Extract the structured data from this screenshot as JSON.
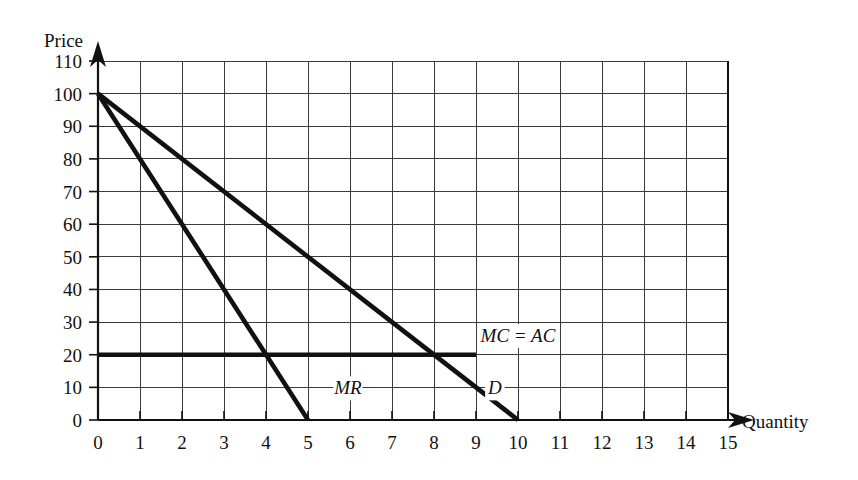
{
  "chart_data": {
    "type": "line",
    "title": "",
    "xlabel": "Quantity",
    "ylabel": "Price",
    "xlim": [
      0,
      15
    ],
    "ylim": [
      0,
      110
    ],
    "xticks": [
      "0",
      "1",
      "2",
      "3",
      "4",
      "5",
      "6",
      "7",
      "8",
      "9",
      "10",
      "11",
      "12",
      "13",
      "14",
      "15"
    ],
    "yticks": [
      "0",
      "10",
      "20",
      "30",
      "40",
      "50",
      "60",
      "70",
      "80",
      "90",
      "100",
      "110"
    ],
    "grid": true,
    "legend_position": "inline-labels",
    "series": [
      {
        "name": "D",
        "label": "D",
        "label_x": 9.45,
        "label_y": 10,
        "type": "line",
        "x": [
          0,
          10
        ],
        "values": [
          100,
          0
        ],
        "slope": -10,
        "intercept": 100,
        "color": "#111111"
      },
      {
        "name": "MR",
        "label": "MR",
        "label_x": 5.95,
        "label_y": 10,
        "type": "line",
        "x": [
          0,
          5
        ],
        "values": [
          100,
          0
        ],
        "slope": -20,
        "intercept": 100,
        "color": "#111111"
      },
      {
        "name": "MC = AC",
        "label": "MC = AC",
        "label_x": 10.0,
        "label_y": 26,
        "type": "line",
        "x": [
          0,
          9
        ],
        "values": [
          20,
          20
        ],
        "slope": 0,
        "intercept": 20,
        "color": "#111111"
      }
    ],
    "annotations": [
      {
        "text": "MR",
        "x": 5.95,
        "y": 10
      },
      {
        "text": "D",
        "x": 9.45,
        "y": 10
      },
      {
        "text": "MC = AC",
        "x": 10.0,
        "y": 26
      }
    ],
    "key_points": [
      {
        "label": "D and MR vertical intercept",
        "x": 0,
        "y": 100
      },
      {
        "label": "MR crosses MC = AC",
        "x": 4,
        "y": 20
      },
      {
        "label": "MR horizontal intercept",
        "x": 5,
        "y": 0
      },
      {
        "label": "D crosses MC = AC",
        "x": 8,
        "y": 20
      },
      {
        "label": "D horizontal intercept",
        "x": 10,
        "y": 0
      }
    ]
  },
  "colors": {
    "curve": "#111111",
    "grid": "#3a3a3a",
    "axis": "#111111",
    "background": "#ffffff"
  }
}
